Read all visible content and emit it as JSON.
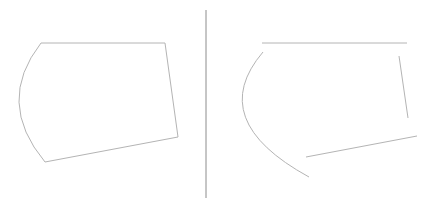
{
  "diagram": {
    "stroke_color": "#b4b4b4",
    "divider_color": "#8c8c8c",
    "left_figure": {
      "label": "closed-shape",
      "top_edge": [
        [
          41,
          43
        ],
        [
          165,
          43
        ]
      ],
      "right_edge": [
        [
          165,
          43
        ],
        [
          178,
          137
        ]
      ],
      "bottom_edge": [
        [
          178,
          137
        ],
        [
          45,
          162
        ]
      ],
      "left_arc": {
        "from": [
          45,
          162
        ],
        "control": [
          -5,
          102
        ],
        "to": [
          41,
          43
        ]
      }
    },
    "divider": {
      "x": 206,
      "y1": 10,
      "y2": 198
    },
    "right_figure": {
      "label": "open-shape",
      "top_edge": [
        [
          262,
          43
        ],
        [
          407,
          43
        ]
      ],
      "right_edge": [
        [
          399,
          56
        ],
        [
          408,
          118
        ]
      ],
      "bottom_edge": [
        [
          306,
          157
        ],
        [
          417,
          136
        ]
      ],
      "left_arc": {
        "from": [
          263,
          52
        ],
        "control": [
          205,
          120
        ],
        "to": [
          309,
          177
        ]
      }
    }
  }
}
